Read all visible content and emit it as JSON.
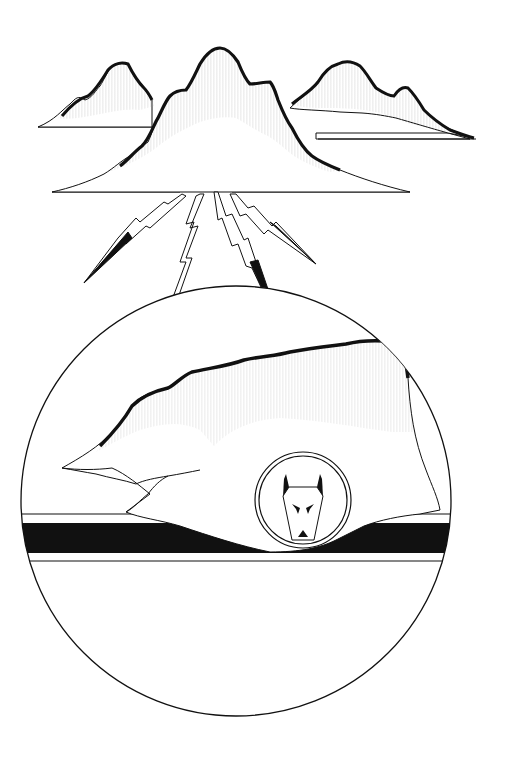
{
  "artwork": {
    "type": "black-and-white pen illustration",
    "elements": [
      "mountain-range",
      "lightning-bolts",
      "circular-emblem",
      "mesa",
      "horizon-band",
      "wolf-medallion"
    ],
    "colors": {
      "ink": "#111111",
      "paper": "#ffffff"
    }
  }
}
